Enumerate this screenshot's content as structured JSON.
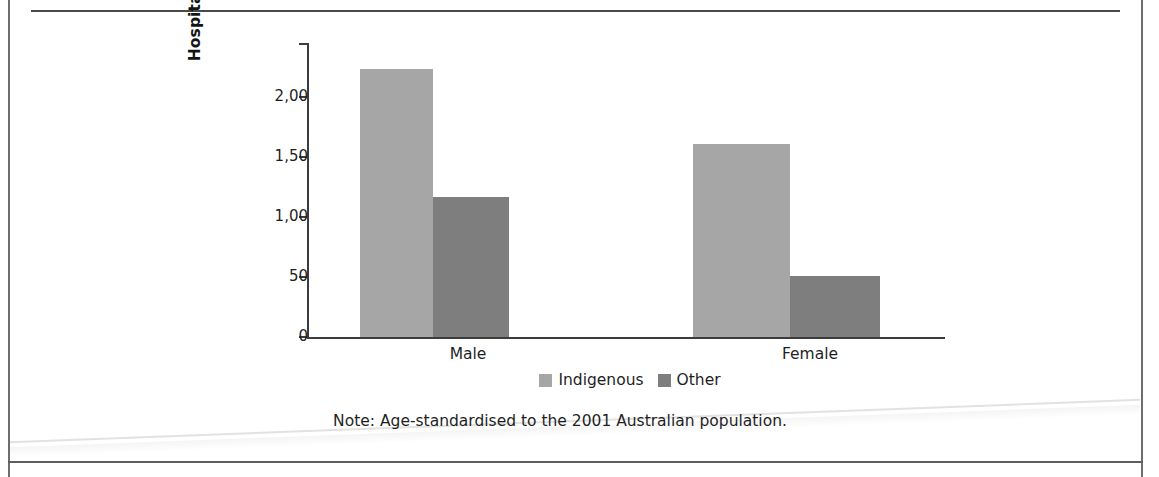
{
  "figure": {
    "note": "Note: Age-standardised to the 2001 Australian population."
  },
  "chart_data": {
    "type": "bar",
    "title": "",
    "subtitle": "",
    "xlabel": "",
    "ylabel": "Hospitalisations per 100,000\npopulation",
    "categories": [
      "Male",
      "Female"
    ],
    "series": [
      {
        "name": "Indigenous",
        "color": "#a6a6a6",
        "values": [
          2230,
          1610
        ]
      },
      {
        "name": "Other",
        "color": "#7e7e7e",
        "values": [
          1170,
          510
        ]
      }
    ],
    "ylim": [
      0,
      2450
    ],
    "yticks": [
      0,
      500,
      1000,
      1500,
      2000
    ],
    "ytick_labels": [
      "0",
      "50",
      "1,00",
      "1,50",
      "2,00"
    ],
    "grid": false,
    "legend_position": "bottom",
    "annotations": [
      "Note: Age-standardised to the 2001 Australian population."
    ]
  }
}
